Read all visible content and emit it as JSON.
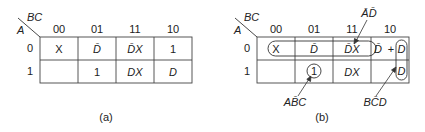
{
  "maps": [
    {
      "id": "a",
      "caption": "(a)",
      "col_var": "BC",
      "row_var": "A",
      "col_headers": [
        "00",
        "01",
        "11",
        "10"
      ],
      "row_headers": [
        "0",
        "1"
      ],
      "cells": [
        [
          "X",
          "D̄",
          "D̄X",
          "1"
        ],
        [
          "",
          "1",
          "DX",
          "D"
        ]
      ]
    },
    {
      "id": "b",
      "caption": "(b)",
      "col_var": "BC",
      "row_var": "A",
      "col_headers": [
        "00",
        "01",
        "11",
        "10"
      ],
      "row_headers": [
        "0",
        "1"
      ],
      "cells": [
        [
          "X",
          "D̄",
          "D̄X",
          "D̄ + D"
        ],
        [
          "",
          "1",
          "DX",
          "D"
        ]
      ],
      "cell_10_row0": {
        "left": "D̄",
        "plus": "+",
        "right": "D"
      },
      "groupings": [
        {
          "label": "ĀD̄",
          "covers": "row 0, columns 00–10 (D̄ terms)"
        },
        {
          "label": "AB̄C",
          "covers": "row 1, column 01 (1)"
        },
        {
          "label": "BC̄D",
          "covers": "column 10, rows 0–1 (D)"
        }
      ]
    }
  ]
}
